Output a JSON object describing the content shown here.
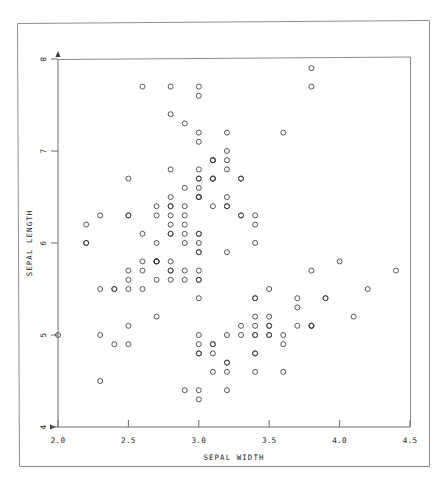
{
  "figure": {
    "background_color": "#ffffff",
    "frame_color": "#8f8f93",
    "axis_color": "#6d6d72",
    "marker_color": "#3a3a3f",
    "text_color": "#1b1b1b"
  },
  "chart_data": {
    "type": "scatter",
    "title": "",
    "xlabel": "SEPAL WIDTH",
    "ylabel": "SEPAL LENGTH",
    "xlim": [
      2.0,
      4.5
    ],
    "ylim": [
      4,
      8
    ],
    "xticks": [
      2.0,
      2.5,
      3.0,
      3.5,
      4.0,
      4.5
    ],
    "xticklabels": [
      "2.0",
      "2.5",
      "3.0",
      "3.5",
      "4.0",
      "4.5"
    ],
    "yticks": [
      4,
      5,
      6,
      7,
      8
    ],
    "yticklabels": [
      "4",
      "5",
      "6",
      "7",
      "8"
    ],
    "grid": false,
    "legend": null,
    "marker": "open-circle",
    "marker_size": 5,
    "series": [
      {
        "name": "iris",
        "x": [
          3.5,
          3.0,
          3.2,
          3.1,
          3.6,
          3.9,
          3.4,
          3.4,
          2.9,
          3.1,
          3.7,
          3.4,
          3.0,
          3.0,
          4.0,
          4.4,
          3.9,
          3.5,
          3.8,
          3.8,
          3.4,
          3.7,
          3.6,
          3.3,
          3.4,
          3.0,
          3.4,
          3.5,
          3.4,
          3.2,
          3.1,
          3.4,
          4.1,
          4.2,
          3.1,
          3.2,
          3.5,
          3.6,
          3.0,
          3.4,
          3.5,
          2.3,
          3.2,
          3.5,
          3.8,
          3.0,
          3.8,
          3.2,
          3.7,
          3.3,
          3.2,
          3.2,
          3.1,
          2.3,
          2.8,
          2.8,
          3.3,
          2.4,
          2.9,
          2.7,
          2.0,
          3.0,
          2.2,
          2.9,
          2.9,
          3.1,
          3.0,
          2.7,
          2.2,
          2.5,
          3.2,
          2.8,
          2.5,
          2.8,
          2.9,
          3.0,
          2.8,
          3.0,
          2.9,
          2.6,
          2.4,
          2.4,
          2.7,
          2.7,
          3.0,
          3.4,
          3.1,
          2.3,
          3.0,
          2.5,
          2.6,
          3.0,
          2.6,
          2.3,
          2.7,
          3.0,
          2.9,
          2.9,
          2.5,
          2.8,
          3.3,
          2.7,
          3.0,
          2.9,
          3.0,
          3.0,
          2.5,
          2.9,
          2.5,
          3.6,
          3.2,
          2.7,
          3.0,
          2.5,
          2.8,
          3.2,
          3.0,
          3.8,
          2.6,
          2.2,
          3.2,
          2.8,
          2.8,
          2.7,
          3.3,
          3.2,
          2.8,
          3.0,
          2.8,
          3.0,
          2.8,
          3.8,
          2.8,
          2.8,
          2.6,
          3.0,
          3.4,
          3.1,
          3.0,
          3.1,
          3.1,
          3.1,
          2.7,
          3.2,
          3.3,
          3.0,
          2.5,
          3.0,
          3.4,
          3.0
        ],
        "y": [
          5.1,
          4.9,
          4.7,
          4.6,
          5.0,
          5.4,
          4.6,
          5.0,
          4.4,
          4.9,
          5.4,
          4.8,
          4.8,
          4.3,
          5.8,
          5.7,
          5.4,
          5.1,
          5.7,
          5.1,
          5.4,
          5.1,
          4.6,
          5.1,
          4.8,
          5.0,
          5.0,
          5.2,
          5.2,
          4.7,
          4.8,
          5.4,
          5.2,
          5.5,
          4.9,
          5.0,
          5.5,
          4.9,
          4.4,
          5.1,
          5.0,
          4.5,
          4.4,
          5.0,
          5.1,
          4.8,
          5.1,
          4.6,
          5.3,
          5.0,
          7.0,
          6.4,
          6.9,
          5.5,
          6.5,
          5.7,
          6.3,
          4.9,
          6.6,
          5.2,
          5.0,
          5.9,
          6.0,
          6.1,
          5.6,
          6.7,
          5.6,
          5.8,
          6.2,
          5.6,
          5.9,
          6.1,
          6.3,
          6.1,
          6.4,
          6.6,
          6.8,
          6.7,
          6.0,
          5.7,
          5.5,
          5.5,
          5.8,
          6.0,
          5.4,
          6.0,
          6.7,
          6.3,
          5.6,
          5.5,
          5.5,
          6.1,
          5.8,
          5.0,
          5.6,
          5.7,
          5.7,
          6.2,
          5.1,
          5.7,
          6.3,
          5.8,
          7.1,
          6.3,
          6.5,
          7.6,
          4.9,
          7.3,
          6.7,
          7.2,
          6.5,
          6.4,
          6.8,
          5.7,
          5.8,
          6.4,
          6.5,
          7.7,
          7.7,
          6.0,
          6.9,
          5.6,
          7.7,
          6.3,
          6.7,
          7.2,
          6.2,
          6.1,
          6.4,
          7.2,
          7.4,
          7.9,
          6.4,
          6.3,
          6.1,
          7.7,
          6.3,
          6.4,
          6.0,
          6.9,
          6.7,
          6.9,
          5.8,
          6.8,
          6.7,
          6.7,
          6.3,
          6.5,
          6.2,
          5.9
        ]
      }
    ]
  }
}
